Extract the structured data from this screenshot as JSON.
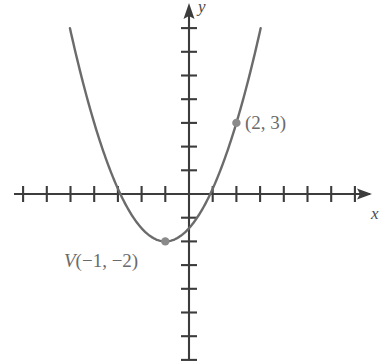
{
  "figure": {
    "kind": "cartesian-plane-parabola-graph",
    "background_color": "#ffffff",
    "axis_color": "#3c3c3c",
    "curve_color": "#6b6b6b",
    "label_color": "#5a5a5a",
    "point_color": "#808080"
  },
  "axes": {
    "x_label": "x",
    "y_label": "y",
    "origin_px": {
      "x": 189,
      "y": 194
    },
    "unit_px": 23.7,
    "x_tick_count_left": 7,
    "x_tick_count_right": 7,
    "y_tick_count_up": 7,
    "y_tick_count_down": 7
  },
  "labels": {
    "vertex_prefix": "V",
    "vertex_coords": "(−1, −2)",
    "vertex_full": "V(−1, −2)",
    "point_coords": "(2, 3)"
  },
  "chart_data": {
    "type": "line",
    "title": "",
    "xlabel": "x",
    "ylabel": "y",
    "grid": false,
    "legend": "none",
    "xlim": [
      -7.5,
      7.5
    ],
    "ylim": [
      -7.5,
      7.5
    ],
    "xticks": [
      -7,
      -6,
      -5,
      -4,
      -3,
      -2,
      -1,
      0,
      1,
      2,
      3,
      4,
      5,
      6,
      7
    ],
    "yticks": [
      -7,
      -6,
      -5,
      -4,
      -3,
      -2,
      -1,
      0,
      1,
      2,
      3,
      4,
      5,
      6,
      7
    ],
    "tick_labels_shown": false,
    "series": [
      {
        "name": "parabola",
        "equation": "y = (5/9)(x + 1)^2 - 2",
        "vertex": [
          -1,
          -2
        ],
        "leading_coefficient": 0.5556,
        "x_intercepts": [
          -2.897,
          0.897
        ],
        "y_intercept": -1.444,
        "x": [
          -3.9,
          -3.5,
          -3.0,
          -2.5,
          -2.0,
          -1.5,
          -1.0,
          -0.5,
          0.0,
          0.5,
          1.0,
          1.5,
          2.0,
          2.5,
          3.0,
          3.2
        ],
        "values": [
          2.69,
          1.47,
          0.22,
          -0.75,
          -1.44,
          -1.86,
          -2.0,
          -1.86,
          -1.44,
          -0.75,
          0.22,
          1.47,
          3.0,
          4.81,
          6.89,
          7.8
        ]
      }
    ],
    "annotations": [
      {
        "label": "V(−1, −2)",
        "point": [
          -1,
          -2
        ],
        "marker": "dot",
        "label_position": "below-left"
      },
      {
        "label": "(2, 3)",
        "point": [
          2,
          3
        ],
        "marker": "dot",
        "label_position": "right"
      }
    ]
  }
}
